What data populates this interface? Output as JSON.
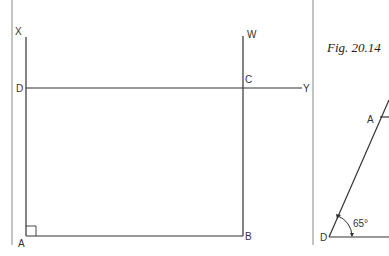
{
  "colors": {
    "stroke": "#333333",
    "divider": "#888888",
    "background": "#ffffff"
  },
  "left_figure": {
    "description": "Rectangle ABCD constructed with lines XA, WB, DY",
    "points": {
      "X": "X",
      "W": "W",
      "D": "D",
      "C": "C",
      "Y": "Y",
      "A": "A",
      "B": "B"
    },
    "right_angle_at": "A"
  },
  "right_figure": {
    "caption": "Fig. 20.14",
    "points": {
      "A": "A",
      "D": "D"
    },
    "angle_label": "65°"
  }
}
